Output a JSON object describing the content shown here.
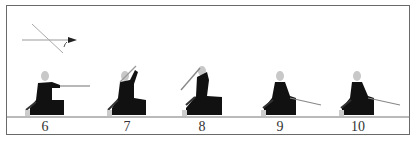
{
  "diagram": {
    "direction_indicator": "direction-arrow-diagram",
    "colors": {
      "frame": "#6a6a6a",
      "figure": "#111111",
      "head": "#c8c8c8",
      "blade": "#8a8a8a",
      "ground": "#777777"
    },
    "steps": [
      {
        "label": "6",
        "x": 45,
        "pose": "thrust-forward"
      },
      {
        "label": "7",
        "x": 127,
        "pose": "raise-sword-overhead"
      },
      {
        "label": "8",
        "x": 202,
        "pose": "sword-raised-back"
      },
      {
        "label": "9",
        "x": 280,
        "pose": "sword-lowered-forward"
      },
      {
        "label": "10",
        "x": 358,
        "pose": "sword-lowered-forward"
      }
    ]
  }
}
